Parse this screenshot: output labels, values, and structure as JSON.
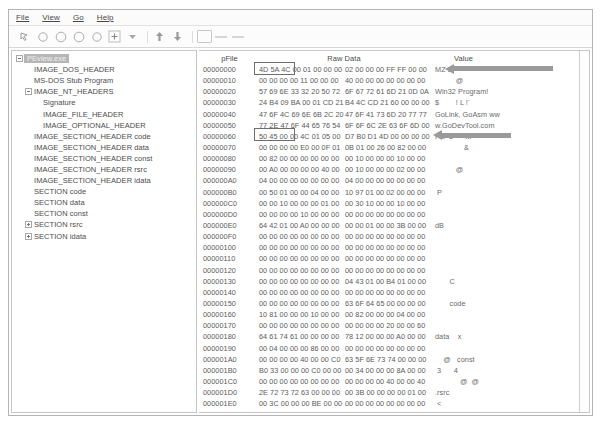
{
  "window": {
    "title": "PEView"
  },
  "menu": {
    "items": [
      {
        "label": "File",
        "mnemonic": "F"
      },
      {
        "label": "View",
        "mnemonic": "V"
      },
      {
        "label": "Go",
        "mnemonic": "G"
      },
      {
        "label": "Help",
        "mnemonic": "H"
      }
    ]
  },
  "toolbar": {
    "buttons": [
      {
        "name": "pointer-icon",
        "glyph": "↖"
      },
      {
        "name": "circle-one-icon",
        "glyph": "○"
      },
      {
        "name": "circle-two-icon",
        "glyph": "○"
      },
      {
        "name": "circle-three-icon",
        "glyph": "○"
      },
      {
        "name": "circle-four-icon",
        "glyph": "○"
      },
      {
        "name": "add-icon",
        "glyph": "+"
      },
      {
        "name": "chevron-down-icon",
        "glyph": "▼"
      },
      {
        "name": "up-arrow-icon",
        "glyph": "↑"
      },
      {
        "name": "down-arrow-icon",
        "glyph": "↓"
      },
      {
        "name": "page-icon",
        "glyph": ""
      }
    ]
  },
  "tree": {
    "selected": "PEview.exe",
    "items": [
      {
        "label": "PEview.exe",
        "indent": 0,
        "twisty": "minus",
        "selected": true
      },
      {
        "label": "IMAGE_DOS_HEADER",
        "indent": 1,
        "twisty": "none",
        "selected": false
      },
      {
        "label": "MS-DOS Stub Program",
        "indent": 1,
        "twisty": "none",
        "selected": false
      },
      {
        "label": "IMAGE_NT_HEADERS",
        "indent": 1,
        "twisty": "minus",
        "selected": false
      },
      {
        "label": "Signature",
        "indent": 2,
        "twisty": "none",
        "selected": false
      },
      {
        "label": "IMAGE_FILE_HEADER",
        "indent": 2,
        "twisty": "none",
        "selected": false
      },
      {
        "label": "IMAGE_OPTIONAL_HEADER",
        "indent": 2,
        "twisty": "none",
        "selected": false
      },
      {
        "label": "IMAGE_SECTION_HEADER code",
        "indent": 1,
        "twisty": "none",
        "selected": false
      },
      {
        "label": "IMAGE_SECTION_HEADER data",
        "indent": 1,
        "twisty": "none",
        "selected": false
      },
      {
        "label": "IMAGE_SECTION_HEADER const",
        "indent": 1,
        "twisty": "none",
        "selected": false
      },
      {
        "label": "IMAGE_SECTION_HEADER rsrc",
        "indent": 1,
        "twisty": "none",
        "selected": false
      },
      {
        "label": "IMAGE_SECTION_HEADER idata",
        "indent": 1,
        "twisty": "none",
        "selected": false
      },
      {
        "label": "SECTION code",
        "indent": 1,
        "twisty": "none",
        "selected": false
      },
      {
        "label": "SECTION data",
        "indent": 1,
        "twisty": "none",
        "selected": false
      },
      {
        "label": "SECTION const",
        "indent": 1,
        "twisty": "none",
        "selected": false
      },
      {
        "label": "SECTION rsrc",
        "indent": 1,
        "twisty": "plus",
        "selected": false
      },
      {
        "label": "SECTION idata",
        "indent": 1,
        "twisty": "plus",
        "selected": false
      }
    ]
  },
  "hex": {
    "columns": {
      "offset": "pFile",
      "raw": "Raw Data",
      "value": "Value"
    },
    "rows": [
      {
        "offset": "00000000",
        "b1": "4D 5A 4C 00 01 00 00 00",
        "b2": "02 00 00 00 FF FF 00 00",
        "value": "MZ L"
      },
      {
        "offset": "00000010",
        "b1": "00 00 00 00 11 00 00 00",
        "b2": "40 00 00 00 00 00 00 00",
        "value": "          @"
      },
      {
        "offset": "00000020",
        "b1": "57 69 6E 33 32 20 50 72",
        "b2": "6F 67 72 61 6D 21 0D 0A",
        "value": "Win32 Program!"
      },
      {
        "offset": "00000030",
        "b1": "24 B4 09 BA 00 01 CD 21",
        "b2": "B4 4C CD 21 60 00 00 00",
        "value": "$        ! L !`"
      },
      {
        "offset": "00000040",
        "b1": "47 6F 4C 69 6E 6B 2C 20",
        "b2": "47 6F 41 73 6D 20 77 77",
        "value": "GoLink, GoAsm ww"
      },
      {
        "offset": "00000050",
        "b1": "77 2E 47 6F 44 65 76 54",
        "b2": "6F 6F 6C 2E 63 6F 6D 00",
        "value": "w.GoDevTool.com"
      },
      {
        "offset": "00000060",
        "b1": "50 45 00 00 4C 01 05 00",
        "b2": "D7 B0 D1 4D 00 00 00 00",
        "value": "PE  L      M"
      },
      {
        "offset": "00000070",
        "b1": "00 00 00 00 E0 00 0F 01",
        "b2": "0B 01 00 26 00 82 00 00",
        "value": "              &"
      },
      {
        "offset": "00000080",
        "b1": "00 82 00 00 00 00 00 00",
        "b2": "00 10 00 00 00 10 00 00",
        "value": ""
      },
      {
        "offset": "00000090",
        "b1": "00 A0 00 00 00 00 40 00",
        "b2": "00 10 00 00 00 02 00 00",
        "value": "          @"
      },
      {
        "offset": "000000A0",
        "b1": "04 00 00 00 00 00 00 00",
        "b2": "04 00 00 00 00 00 00 00",
        "value": ""
      },
      {
        "offset": "000000B0",
        "b1": "00 50 01 00 00 04 00 00",
        "b2": "10 97 01 00 02 00 00 00",
        "value": " P"
      },
      {
        "offset": "000000C0",
        "b1": "00 00 10 00 00 00 01 00",
        "b2": "00 30 10 00 00 10 00 00",
        "value": ""
      },
      {
        "offset": "000000D0",
        "b1": "00 00 00 00 10 00 00 00",
        "b2": "00 00 00 00 00 00 00 00",
        "value": ""
      },
      {
        "offset": "000000E0",
        "b1": "64 42 01 00 A0 00 00 00",
        "b2": "00 00 01 00 00 3B 00 00",
        "value": "dB"
      },
      {
        "offset": "000000F0",
        "b1": "00 00 00 00 00 00 00 00",
        "b2": "00 00 00 00 00 00 00 00",
        "value": ""
      },
      {
        "offset": "00000100",
        "b1": "00 00 00 00 00 00 00 00",
        "b2": "00 00 00 00 00 00 00 00",
        "value": ""
      },
      {
        "offset": "00000110",
        "b1": "00 00 00 00 00 00 00 00",
        "b2": "00 00 00 00 00 00 00 00",
        "value": ""
      },
      {
        "offset": "00000120",
        "b1": "00 00 00 00 00 00 00 00",
        "b2": "00 00 00 00 00 00 00 00",
        "value": ""
      },
      {
        "offset": "00000130",
        "b1": "00 00 00 00 00 00 00 00",
        "b2": "04 43 01 00 B4 01 00 00",
        "value": "       C"
      },
      {
        "offset": "00000140",
        "b1": "00 00 00 00 00 00 00 00",
        "b2": "00 00 00 00 00 00 00 00",
        "value": ""
      },
      {
        "offset": "00000150",
        "b1": "00 00 00 00 00 00 00 00",
        "b2": "63 6F 64 65 00 00 00 00",
        "value": "       code"
      },
      {
        "offset": "00000160",
        "b1": "10 81 00 00 00 10 00 00",
        "b2": "00 82 00 00 00 04 00 00",
        "value": ""
      },
      {
        "offset": "00000170",
        "b1": "00 00 00 00 00 00 00 00",
        "b2": "00 00 00 00 20 00 00 60",
        "value": ""
      },
      {
        "offset": "00000180",
        "b1": "64 61 74 61 00 00 00 00",
        "b2": "78 12 00 00 00 A0 00 00",
        "value": "data    x"
      },
      {
        "offset": "00000190",
        "b1": "00 04 00 00 00 86 00 00",
        "b2": "00 00 00 00 00 00 00 00",
        "value": ""
      },
      {
        "offset": "000001A0",
        "b1": "00 00 00 00 40 00 00 C0",
        "b2": "63 5F 6E 73 74 00 00 00",
        "value": "    @   const"
      },
      {
        "offset": "000001B0",
        "b1": "B0 33 00 00 00 C0 00 00",
        "b2": "00 34 00 00 00 8A 00 00",
        "value": " 3      4"
      },
      {
        "offset": "000001C0",
        "b1": "00 00 00 00 00 00 00 00",
        "b2": "00 00 00 00 40 00 00 40",
        "value": "            @  @"
      },
      {
        "offset": "000001D0",
        "b1": "2E 72 73 72 63 00 00 00",
        "b2": "00 3B 00 00 00 00 01 00",
        "value": ".rsrc"
      },
      {
        "offset": "000001E0",
        "b1": "00 3C 00 00 00 BE 00 00",
        "b2": "00 00 00 00 00 00 00 00",
        "value": " <"
      },
      {
        "offset": "000001F0",
        "b1": "00 00 00 00 40 00 00 40",
        "b2": "2E 69 64 61 74 61 00 00",
        "value": "    @  @ .idata"
      },
      {
        "offset": "00000200",
        "b1": "56 0D 00 00 00 40 01 00",
        "b2": "00 0E 00 00 00 FA 00 00",
        "value": "V     @"
      },
      {
        "offset": "00000210",
        "b1": "00 00 00 00 00 00 00 00",
        "b2": "00 00 00 00 20 00 00 60",
        "value": ""
      }
    ]
  },
  "annotations": {
    "boxes": [
      {
        "name": "mz-signature-highlight",
        "target_offset": "00000000",
        "bytes": "4D 5A"
      },
      {
        "name": "pe-signature-highlight",
        "target_offset": "00000060",
        "bytes": "50 45"
      }
    ],
    "arrows": [
      {
        "name": "mz-callout-arrow",
        "target_offset": "00000000",
        "direction": "left"
      },
      {
        "name": "pe-callout-arrow",
        "target_offset": "00000060",
        "direction": "left"
      }
    ]
  },
  "colors": {
    "selection_bg": "#b6b6b6",
    "annotation_box": "#6e6e6e",
    "annotation_arrow": "#9a9a9a",
    "panel_border": "#c6c6c6",
    "text": "#4b4b4b"
  }
}
